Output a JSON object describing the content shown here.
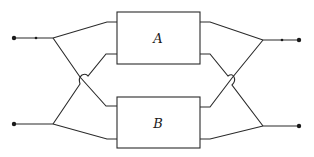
{
  "diagram": {
    "type": "block-diagram",
    "blocks": [
      {
        "id": "A",
        "label": "A"
      },
      {
        "id": "B",
        "label": "B"
      }
    ],
    "terminals": {
      "inputs": [
        "input-top",
        "input-bottom"
      ],
      "outputs": [
        "output-top",
        "output-bottom"
      ]
    },
    "colors": {
      "line": "#2a2a2a",
      "background": "#ffffff"
    }
  }
}
